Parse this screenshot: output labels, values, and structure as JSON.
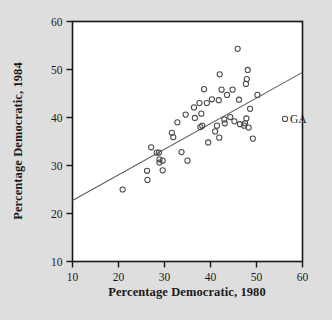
{
  "figure": {
    "background_color": "#dedede",
    "panel_color": "#ffffff",
    "frame_color": "#15171a",
    "point_color": "#4a4a4a",
    "line_color": "#5c5c5c"
  },
  "chart_data": {
    "type": "scatter",
    "title": "",
    "xlabel": "Percentage Democratic, 1980",
    "ylabel": "Percentage Democratic, 1984",
    "xlim": [
      7,
      62
    ],
    "ylim": [
      7,
      62
    ],
    "xticks": [
      10,
      20,
      30,
      40,
      50,
      60
    ],
    "yticks": [
      10,
      20,
      30,
      40,
      50,
      60
    ],
    "xtick_labels": [
      "10",
      "20",
      "30",
      "40",
      "50",
      "60"
    ],
    "ytick_labels": [
      "10",
      "20",
      "30",
      "40",
      "50",
      "60"
    ],
    "grid": false,
    "legend": false,
    "marker": "open-circle",
    "points": [
      {
        "x": 20.9,
        "y": 25.0
      },
      {
        "x": 26.2,
        "y": 28.9
      },
      {
        "x": 26.3,
        "y": 27.0
      },
      {
        "x": 27.1,
        "y": 33.8
      },
      {
        "x": 28.3,
        "y": 32.7
      },
      {
        "x": 28.8,
        "y": 32.7
      },
      {
        "x": 28.9,
        "y": 31.3
      },
      {
        "x": 28.9,
        "y": 30.6
      },
      {
        "x": 29.6,
        "y": 31.0
      },
      {
        "x": 29.6,
        "y": 29.0
      },
      {
        "x": 31.6,
        "y": 36.8
      },
      {
        "x": 31.9,
        "y": 35.9
      },
      {
        "x": 32.8,
        "y": 39.0
      },
      {
        "x": 33.7,
        "y": 32.8
      },
      {
        "x": 34.6,
        "y": 40.6
      },
      {
        "x": 35.0,
        "y": 31.0
      },
      {
        "x": 36.4,
        "y": 42.1
      },
      {
        "x": 36.6,
        "y": 39.9
      },
      {
        "x": 37.6,
        "y": 43.0
      },
      {
        "x": 37.8,
        "y": 38.0
      },
      {
        "x": 38.0,
        "y": 40.8
      },
      {
        "x": 38.2,
        "y": 38.3
      },
      {
        "x": 38.6,
        "y": 45.9
      },
      {
        "x": 39.2,
        "y": 43.0
      },
      {
        "x": 39.5,
        "y": 34.8
      },
      {
        "x": 40.3,
        "y": 43.8
      },
      {
        "x": 41.0,
        "y": 37.1
      },
      {
        "x": 41.4,
        "y": 38.3
      },
      {
        "x": 41.8,
        "y": 43.6
      },
      {
        "x": 41.9,
        "y": 35.8
      },
      {
        "x": 42.0,
        "y": 49.0
      },
      {
        "x": 42.4,
        "y": 45.8
      },
      {
        "x": 43.0,
        "y": 39.6
      },
      {
        "x": 43.1,
        "y": 38.8
      },
      {
        "x": 43.6,
        "y": 44.7
      },
      {
        "x": 44.3,
        "y": 40.1
      },
      {
        "x": 44.8,
        "y": 45.8
      },
      {
        "x": 45.2,
        "y": 39.2
      },
      {
        "x": 45.9,
        "y": 54.3
      },
      {
        "x": 46.2,
        "y": 43.7
      },
      {
        "x": 46.4,
        "y": 38.6
      },
      {
        "x": 47.3,
        "y": 38.3
      },
      {
        "x": 47.5,
        "y": 38.8
      },
      {
        "x": 47.7,
        "y": 47.0
      },
      {
        "x": 47.8,
        "y": 39.8
      },
      {
        "x": 47.9,
        "y": 48.0
      },
      {
        "x": 48.1,
        "y": 49.9
      },
      {
        "x": 48.3,
        "y": 37.9
      },
      {
        "x": 48.6,
        "y": 41.8
      },
      {
        "x": 49.2,
        "y": 35.6
      },
      {
        "x": 50.2,
        "y": 44.7
      }
    ],
    "annotated_points": [
      {
        "x": 56.2,
        "y": 39.7,
        "label": "GA"
      }
    ],
    "fit_line": {
      "description": "least-squares regression line",
      "x_start": 10,
      "y_start": 22.7,
      "x_end": 60,
      "y_end": 49.4
    }
  }
}
